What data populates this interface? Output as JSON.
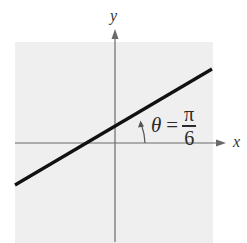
{
  "diagram": {
    "type": "coordinate-plane-line-inclination",
    "axes": {
      "x_label": "x",
      "y_label": "y"
    },
    "line": {
      "description": "straight line with positive slope crossing x-axis left of origin",
      "inclination_angle": "π/6"
    },
    "angle_annotation": {
      "symbol": "θ",
      "equals": "=",
      "numerator": "π",
      "denominator": "6"
    },
    "colors": {
      "plot_background": "#efefef",
      "axis": "#666666",
      "line": "#111111",
      "text": "#2a2a2a"
    }
  }
}
